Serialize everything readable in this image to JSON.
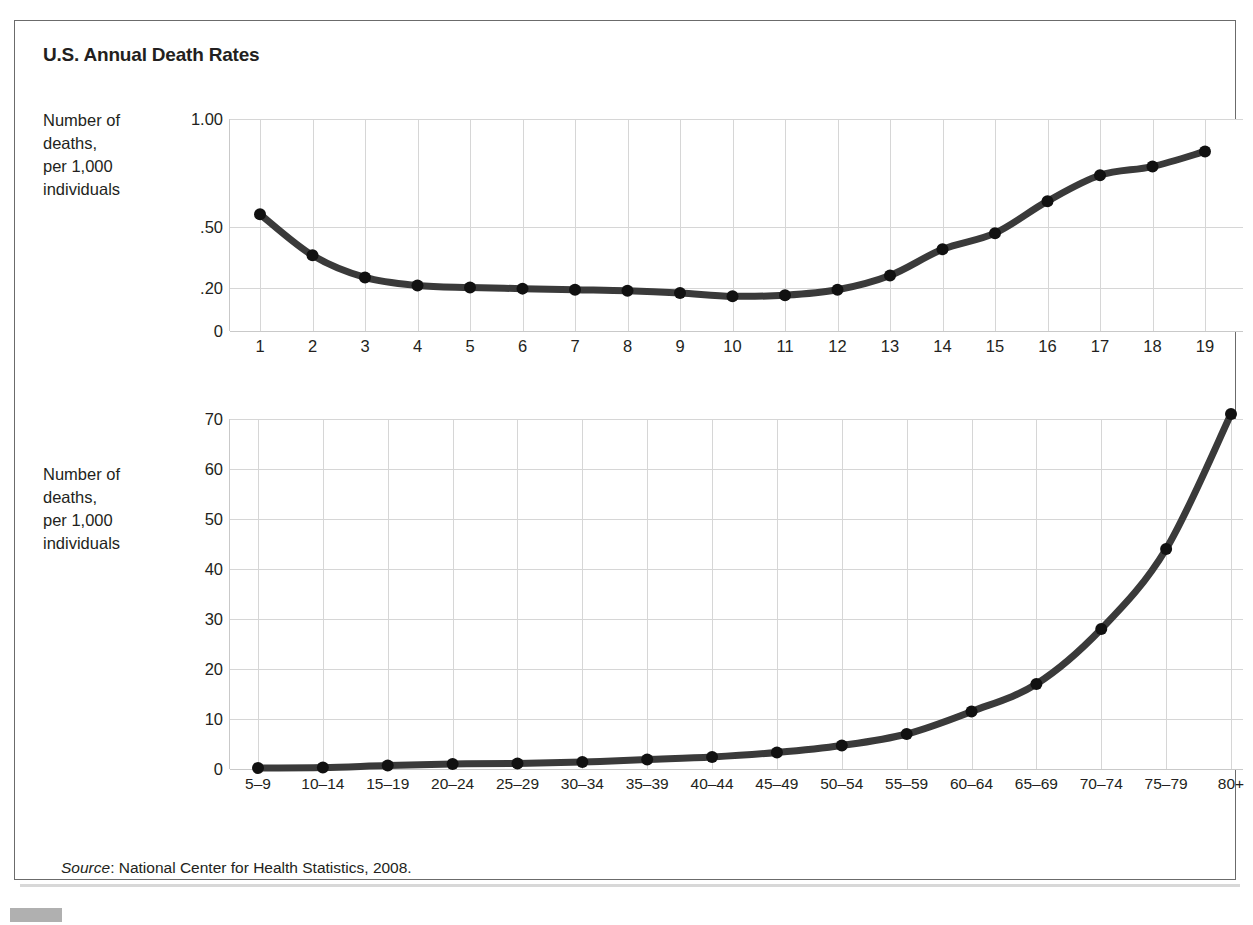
{
  "figure": {
    "title": "U.S. Annual Death Rates",
    "source_prefix": "Source",
    "source_text": ": National Center for Health Statistics, 2008."
  },
  "top_chart": {
    "y_caption": "Number of\ndeaths,\nper 1,000\nindividuals",
    "xlabel": "Age (years)"
  },
  "bottom_chart": {
    "y_caption": "Number of\ndeaths,\nper 1,000\nindividuals",
    "xlabel": "Age (years)"
  },
  "chart_data": [
    {
      "type": "line",
      "id": "child-death-rates",
      "title": "U.S. Annual Death Rates",
      "xlabel": "Age (years)",
      "ylabel": "Number of deaths, per 1,000 individuals",
      "x": [
        1,
        2,
        3,
        4,
        5,
        6,
        7,
        8,
        9,
        10,
        11,
        12,
        13,
        14,
        15,
        16,
        17,
        18,
        19
      ],
      "values": [
        0.56,
        0.36,
        0.25,
        0.21,
        0.2,
        0.195,
        0.19,
        0.185,
        0.175,
        0.16,
        0.165,
        0.19,
        0.26,
        0.39,
        0.47,
        0.62,
        0.74,
        0.78,
        0.85
      ],
      "ytick_labels": [
        "1.00",
        ".50",
        ".20",
        "0"
      ],
      "ytick_values": [
        1.0,
        0.5,
        0.2,
        0
      ],
      "ytick_fracs": [
        1.0,
        0.49,
        0.205,
        0.0
      ],
      "xtick_labels": [
        "1",
        "2",
        "3",
        "4",
        "5",
        "6",
        "7",
        "8",
        "9",
        "10",
        "11",
        "12",
        "13",
        "14",
        "15",
        "16",
        "17",
        "18",
        "19"
      ],
      "ylim": [
        0,
        1.0
      ],
      "grid": true,
      "legend": "none"
    },
    {
      "type": "line",
      "id": "adult-death-rates",
      "title": "U.S. Annual Death Rates",
      "xlabel": "Age (years)",
      "ylabel": "Number of deaths, per 1,000 individuals",
      "categories": [
        "5–9",
        "10–14",
        "15–19",
        "20–24",
        "25–29",
        "30–34",
        "35–39",
        "40–44",
        "45–49",
        "50–54",
        "55–59",
        "60–64",
        "65–69",
        "70–74",
        "75–79",
        "80+"
      ],
      "values": [
        0.2,
        0.3,
        0.7,
        1.0,
        1.1,
        1.4,
        1.9,
        2.4,
        3.3,
        4.7,
        7.0,
        11.5,
        17.0,
        28.0,
        44.0,
        71.0
      ],
      "ytick_labels": [
        "0",
        "10",
        "20",
        "30",
        "40",
        "50",
        "60",
        "70"
      ],
      "ytick_values": [
        0,
        10,
        20,
        30,
        40,
        50,
        60,
        70
      ],
      "ylim": [
        0,
        70
      ],
      "grid": true,
      "legend": "none"
    }
  ]
}
